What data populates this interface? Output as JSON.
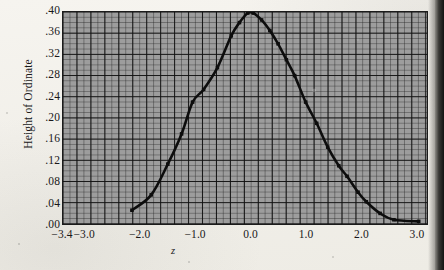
{
  "figure": {
    "y_axis_title": "Height of Ordinate",
    "x_axis_title": "z"
  },
  "chart_data": {
    "type": "line",
    "title": "",
    "subtitle": "",
    "xlabel": "z",
    "ylabel": "Height of Ordinate",
    "xlim": [
      -3.4,
      3.2
    ],
    "ylim": [
      0.0,
      0.4
    ],
    "grid": true,
    "legend": null,
    "x_ticks": [
      {
        "value": -3.4,
        "label": "−3.4"
      },
      {
        "value": -3.0,
        "label": "−3.0"
      },
      {
        "value": -2.0,
        "label": "−2.0"
      },
      {
        "value": -1.0,
        "label": "−1.0"
      },
      {
        "value": 0.0,
        "label": "0.0"
      },
      {
        "value": 1.0,
        "label": "1.0"
      },
      {
        "value": 2.0,
        "label": "2.0"
      },
      {
        "value": 3.0,
        "label": "3.0"
      }
    ],
    "y_ticks": [
      {
        "value": 0.4,
        "label": ".40"
      },
      {
        "value": 0.36,
        "label": ".36"
      },
      {
        "value": 0.32,
        "label": ".32"
      },
      {
        "value": 0.28,
        "label": ".28"
      },
      {
        "value": 0.24,
        "label": ".24"
      },
      {
        "value": 0.2,
        "label": ".20"
      },
      {
        "value": 0.16,
        "label": ".16"
      },
      {
        "value": 0.12,
        "label": ".12"
      },
      {
        "value": 0.08,
        "label": ".08"
      },
      {
        "value": 0.04,
        "label": ".04"
      },
      {
        "value": 0.0,
        "label": ".00"
      }
    ],
    "series": [
      {
        "name": "Normal curve ordinate",
        "color": "#0d0d0d",
        "marker": "square",
        "x": [
          -2.15,
          -1.8,
          -1.5,
          -1.25,
          -1.05,
          -0.85,
          -0.6,
          -0.35,
          -0.2,
          -0.05,
          0.05,
          0.2,
          0.35,
          0.5,
          0.65,
          0.8,
          1.0,
          1.2,
          1.4,
          1.6,
          1.75,
          1.95,
          2.1,
          2.35,
          2.6,
          3.05
        ],
        "y": [
          0.026,
          0.055,
          0.113,
          0.17,
          0.23,
          0.254,
          0.295,
          0.355,
          0.38,
          0.398,
          0.398,
          0.385,
          0.365,
          0.34,
          0.31,
          0.28,
          0.23,
          0.19,
          0.145,
          0.11,
          0.09,
          0.06,
          0.042,
          0.02,
          0.008,
          0.005
        ]
      }
    ]
  }
}
